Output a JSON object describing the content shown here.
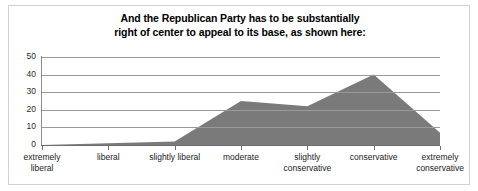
{
  "figure": {
    "title_line1": "And the Republican Party has to be substantially",
    "title_line2": "right of center to appeal to its base, as shown here:",
    "border_color": "#d2d2d2",
    "background_color": "#ffffff"
  },
  "chart_data": {
    "type": "area",
    "title": "And the Republican Party has to be substantially right of center to appeal to its base, as shown here:",
    "categories": [
      "extremely liberal",
      "liberal",
      "slightly liberal",
      "moderate",
      "slightly conservative",
      "conservative",
      "extremely conservative"
    ],
    "category_lines": [
      [
        "extremely",
        "liberal"
      ],
      [
        "liberal"
      ],
      [
        "slightly liberal"
      ],
      [
        "moderate"
      ],
      [
        "slightly",
        "conservative"
      ],
      [
        "conservative"
      ],
      [
        "extremely",
        "conservative"
      ]
    ],
    "values": [
      0,
      1,
      2,
      25,
      22,
      40,
      7
    ],
    "xlabel": "",
    "ylabel": "",
    "ylim": [
      0,
      50
    ],
    "yticks": [
      0,
      10,
      20,
      30,
      40,
      50
    ],
    "ytick_labels": [
      "0",
      "10",
      "20",
      "30",
      "40",
      "50"
    ],
    "grid": true,
    "legend": false,
    "series_fill_color": "#7a7a7a",
    "gridline_color": "#9a9a9a",
    "axis_color": "#6e6e6e"
  }
}
